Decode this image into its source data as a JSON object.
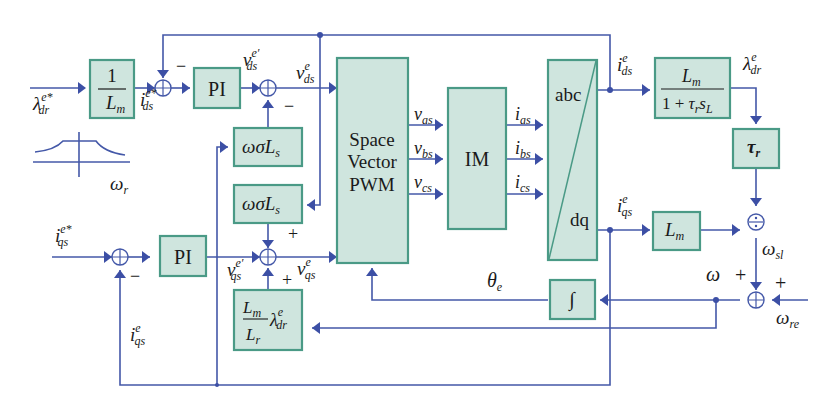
{
  "colors": {
    "block_fill": "#cfe5de",
    "block_border": "#4a9a86",
    "signal_line": "#4458a8",
    "text": "#1a1a1a"
  },
  "blocks": {
    "inv_lm": {
      "num": "1",
      "den_main": "L",
      "den_sub": "m"
    },
    "pi_d": {
      "label": "PI"
    },
    "pi_q": {
      "label": "PI"
    },
    "wsls_top": {
      "main": "ωσL",
      "sub": "s"
    },
    "wsls_bottom": {
      "main": "ωσL",
      "sub": "s"
    },
    "lm_lr_lambda": {
      "num_main": "L",
      "num_sub": "m",
      "den_main": "L",
      "den_sub": "r",
      "lambda": "λ",
      "lambda_sup": "e",
      "lambda_sub": "dr"
    },
    "svpwm": {
      "line1": "Space",
      "line2": "Vector",
      "line3": "PWM"
    },
    "im": {
      "label": "IM"
    },
    "abc_dq": {
      "top": "abc",
      "bottom": "dq"
    },
    "flux_tf": {
      "num_main": "L",
      "num_sub": "m",
      "den_prefix": "1 + ",
      "den_tau": "τ",
      "den_tau_sub": "r",
      "den_s": "s",
      "den_s_sub": "L"
    },
    "tau_r": {
      "main": "τ",
      "sub": "r"
    },
    "lm_q": {
      "main": "L",
      "sub": "m"
    },
    "integrator": {
      "label": "∫"
    }
  },
  "signals": {
    "lambda_ref": {
      "main": "λ",
      "sup": "e*",
      "sub": "dr"
    },
    "ids_ref": {
      "main": "i",
      "sup": "e*",
      "sub": "ds"
    },
    "vds_prime": {
      "main": "v",
      "sup": "e′",
      "sub": "ds"
    },
    "vds": {
      "main": "v",
      "sup": "e",
      "sub": "ds"
    },
    "iqs_ref": {
      "main": "i",
      "sup": "e*",
      "sub": "qs"
    },
    "vqs_prime": {
      "main": "v",
      "sup": "e′",
      "sub": "qs"
    },
    "vqs": {
      "main": "v",
      "sup": "e",
      "sub": "qs"
    },
    "iqs_fb": {
      "main": "i",
      "sup": "e",
      "sub": "qs"
    },
    "vas": {
      "main": "v",
      "sub": "as"
    },
    "vbs": {
      "main": "v",
      "sub": "bs"
    },
    "vcs": {
      "main": "v",
      "sub": "cs"
    },
    "ias": {
      "main": "i",
      "sub": "as"
    },
    "ibs": {
      "main": "i",
      "sub": "bs"
    },
    "ics": {
      "main": "i",
      "sub": "cs"
    },
    "ids": {
      "main": "i",
      "sup": "e",
      "sub": "ds"
    },
    "iqs": {
      "main": "i",
      "sup": "e",
      "sub": "qs"
    },
    "lambda_dr": {
      "main": "λ",
      "sup": "e",
      "sub": "dr"
    },
    "theta_e": {
      "main": "θ",
      "sub": "e"
    },
    "omega": {
      "main": "ω"
    },
    "omega_sl": {
      "main": "ω",
      "sub": "sl"
    },
    "omega_re": {
      "main": "ω",
      "sub": "re"
    },
    "omega_r": {
      "main": "ω",
      "sub": "r"
    }
  },
  "signs": {
    "minus": "−",
    "plus": "+"
  }
}
